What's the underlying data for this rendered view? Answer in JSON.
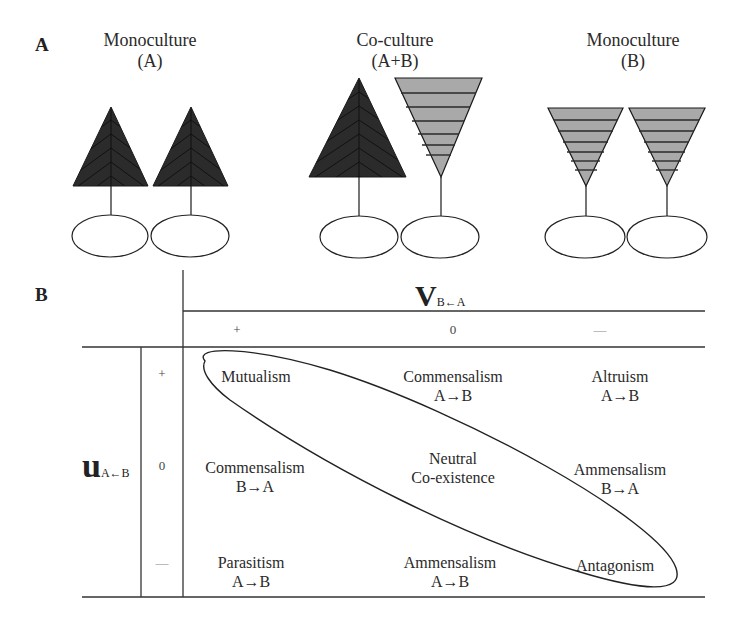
{
  "panel_a": {
    "label": "A",
    "groups": [
      {
        "title_line1": "Monoculture",
        "title_line2": "(A)",
        "plants": [
          "A",
          "A"
        ]
      },
      {
        "title_line1": "Co-culture",
        "title_line2": "(A+B)",
        "plants": [
          "A",
          "B"
        ]
      },
      {
        "title_line1": "Monoculture",
        "title_line2": "(B)",
        "plants": [
          "B",
          "B"
        ]
      }
    ],
    "colors": {
      "species_a_fill": "#2b2b2b",
      "species_b_fill": "#a9a9a9",
      "stroke": "#1a1a1a"
    }
  },
  "panel_b": {
    "label": "B",
    "col_axis": {
      "symbol": "V",
      "subscript": "B←A",
      "signs": [
        "+",
        "0",
        "—"
      ]
    },
    "row_axis": {
      "symbol": "u",
      "subscript": "A←B",
      "signs": [
        "+",
        "0",
        "—"
      ]
    },
    "cells": [
      [
        {
          "line1": "Mutualism",
          "line2": ""
        },
        {
          "line1": "Commensalism",
          "line2": "A→B"
        },
        {
          "line1": "Altruism",
          "line2": "A→B"
        }
      ],
      [
        {
          "line1": "Commensalism",
          "line2": "B→A"
        },
        {
          "line1": "Neutral",
          "line2": "Co-existence"
        },
        {
          "line1": "Ammensalism",
          "line2": "B→A"
        }
      ],
      [
        {
          "line1": "Parasitism",
          "line2": "A→B"
        },
        {
          "line1": "Ammensalism",
          "line2": "A→B"
        },
        {
          "line1": "Antagonism",
          "line2": ""
        }
      ]
    ]
  }
}
